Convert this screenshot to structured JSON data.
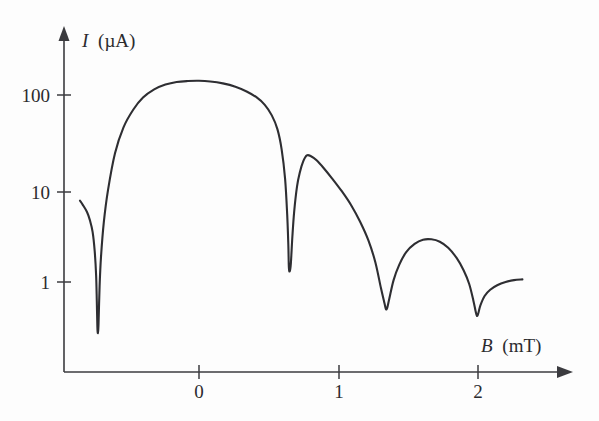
{
  "figure": {
    "background_color": "#fdfdfd",
    "curve_color": "#2e2e32",
    "axis_color": "#3b3b3f"
  },
  "axes": {
    "y_title_symbol": "I",
    "y_title_unit": "(µA)",
    "x_title_symbol": "B",
    "x_title_unit": "(mT)",
    "y_ticks": [
      "1",
      "10",
      "100"
    ],
    "x_ticks": [
      "0",
      "1",
      "2"
    ]
  },
  "chart_data": {
    "type": "line",
    "title": "",
    "xlabel": "B (mT)",
    "ylabel": "I (µA)",
    "xscale": "linear",
    "yscale": "log",
    "xlim": [
      -0.96,
      2.67
    ],
    "ylim": [
      0.15,
      400
    ],
    "xticks": [
      0,
      1,
      2
    ],
    "yticks": [
      1,
      10,
      100
    ],
    "grid": false,
    "legend": null,
    "series": [
      {
        "name": "Critical current diffraction pattern",
        "x": [
          -0.85,
          -0.83,
          -0.8,
          -0.78,
          -0.76,
          -0.745,
          -0.735,
          -0.73,
          -0.726,
          -0.722,
          -0.718,
          -0.71,
          -0.7,
          -0.68,
          -0.65,
          -0.6,
          -0.54,
          -0.47,
          -0.4,
          -0.32,
          -0.24,
          -0.16,
          -0.08,
          0.0,
          0.08,
          0.17,
          0.26,
          0.34,
          0.41,
          0.47,
          0.52,
          0.56,
          0.59,
          0.615,
          0.63,
          0.638,
          0.642,
          0.648,
          0.656,
          0.667,
          0.68,
          0.7,
          0.72,
          0.745,
          0.77,
          0.8,
          0.84,
          0.89,
          0.95,
          1.02,
          1.09,
          1.15,
          1.21,
          1.26,
          1.3,
          1.325,
          1.335,
          1.345,
          1.36,
          1.39,
          1.43,
          1.48,
          1.54,
          1.6,
          1.66,
          1.72,
          1.78,
          1.84,
          1.89,
          1.93,
          1.96,
          1.975,
          1.985,
          1.995,
          2.01,
          2.04,
          2.08,
          2.13,
          2.19,
          2.25,
          2.31
        ],
        "y": [
          8.0,
          7.2,
          6.0,
          4.9,
          3.6,
          2.2,
          1.2,
          0.62,
          0.32,
          0.27,
          0.33,
          0.9,
          1.9,
          4.6,
          10.5,
          27,
          52,
          82,
          112,
          138,
          156,
          167,
          171,
          172,
          169,
          161,
          148,
          131,
          113,
          93,
          71,
          50,
          30,
          14,
          5.6,
          2.6,
          1.45,
          1.32,
          1.6,
          3.2,
          6.1,
          11.5,
          16.5,
          22,
          25.5,
          25.0,
          22.5,
          18.5,
          14.2,
          10.2,
          7.0,
          4.7,
          2.9,
          1.65,
          0.85,
          0.58,
          0.5,
          0.52,
          0.66,
          1.05,
          1.55,
          2.15,
          2.65,
          2.95,
          2.98,
          2.8,
          2.4,
          1.85,
          1.35,
          0.95,
          0.62,
          0.48,
          0.42,
          0.45,
          0.55,
          0.7,
          0.82,
          0.92,
          1.0,
          1.05,
          1.07
        ]
      }
    ],
    "annotations": {
      "peak_values_uA": [
        172,
        25.5,
        2.98
      ],
      "peak_positions_mT": [
        0.0,
        0.77,
        1.64
      ],
      "minima_positions_mT": [
        -0.722,
        0.642,
        1.335,
        1.985
      ]
    }
  }
}
